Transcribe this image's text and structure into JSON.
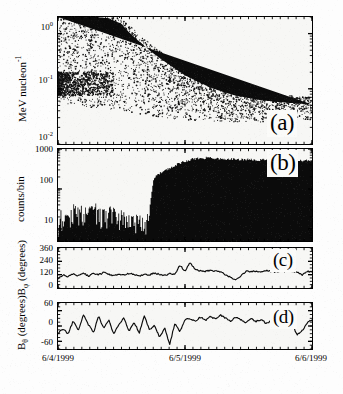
{
  "figure": {
    "background_color": "#fdfdfd",
    "ink_color": "#000000",
    "panel_fill": "#f7f7f5"
  },
  "axis": {
    "x_label_ticks": [
      "6/4/1999",
      "6/5/1999",
      "6/6/1999"
    ],
    "x_range_start": "6/4/1999",
    "x_range_end": "6/6/1999"
  },
  "panels": [
    {
      "id": "a",
      "letter": "(a)",
      "ylabel_text": "MeV nucleon",
      "ylabel_sup": "-1",
      "yticks": [
        "10",
        "10",
        "10"
      ],
      "ytick_exps": [
        "0",
        "-1",
        "-2"
      ],
      "type": "scatter"
    },
    {
      "id": "b",
      "letter": "(b)",
      "ylabel_text": "counts/bin",
      "yticks": [
        "1000",
        "100",
        "10"
      ],
      "type": "area"
    },
    {
      "id": "c",
      "letter": "(c)",
      "ylabel_text": "B",
      "ylabel_sub": "φ",
      "ylabel_unit": " (degrees)",
      "yticks": [
        "360",
        "240",
        "120",
        "0"
      ],
      "type": "line"
    },
    {
      "id": "d",
      "letter": "(d)",
      "ylabel_text": "B",
      "ylabel_sub": "θ",
      "ylabel_unit": " (degrees)",
      "yticks": [
        "60",
        "0",
        "-60"
      ],
      "type": "line"
    }
  ],
  "ylabel_combined": {
    "b_theta": "B",
    "b_theta_sub": "θ",
    "mid": " (degrees)B",
    "b_phi_sub": "φ",
    "tail": " (degrees)"
  },
  "chart_data": {
    "type": "line",
    "xlabel": "",
    "x_tick_labels": [
      "6/4/1999",
      "6/5/1999",
      "6/6/1999"
    ],
    "x_tick_fractions": [
      0.0,
      0.5,
      1.0
    ],
    "panels": [
      {
        "panel": "a",
        "type": "scatter",
        "ylabel": "MeV nucleon^-1",
        "yscale": "log",
        "ylim": [
          0.01,
          2.0
        ],
        "ytick_values": [
          1.0,
          0.1,
          0.01
        ],
        "ytick_labels": [
          "10^0",
          "10^-1",
          "10^-2"
        ],
        "description": "Ion energy vs arrival-time spectrogram showing velocity dispersion; onset boundary sweeps from high energy early to low energy later, saturating black above the boundary after 6/5/1999.",
        "dispersion_boundary": {
          "comment": "lower-energy cutoff of the dense (black) region, energy in MeV/nuc vs fraction of x axis",
          "x_fraction": [
            0.0,
            0.05,
            0.1,
            0.15,
            0.2,
            0.25,
            0.28,
            0.32,
            0.36,
            0.4,
            0.45,
            0.5,
            0.55,
            0.6,
            0.65,
            0.7,
            0.8,
            0.9,
            1.0
          ],
          "energy": [
            2.0,
            2.0,
            2.0,
            2.0,
            1.9,
            1.5,
            1.05,
            0.72,
            0.5,
            0.36,
            0.25,
            0.175,
            0.135,
            0.105,
            0.088,
            0.075,
            0.062,
            0.056,
            0.052
          ]
        },
        "sparse_cloud_lower_edge": {
          "x_fraction": [
            0.0,
            0.1,
            0.2,
            0.3,
            0.4,
            0.5,
            0.6,
            0.7,
            0.8,
            0.9,
            1.0
          ],
          "energy": [
            0.055,
            0.048,
            0.042,
            0.036,
            0.03,
            0.027,
            0.026,
            0.025,
            0.025,
            0.026,
            0.028
          ]
        }
      },
      {
        "panel": "b",
        "type": "area",
        "ylabel": "counts/bin",
        "yscale": "log",
        "ylim": [
          5,
          1000
        ],
        "ytick_values": [
          1000,
          100,
          10
        ],
        "ytick_labels": [
          "1000",
          "100",
          "10"
        ],
        "description": "Count rate histogram: quiet background near 15-30 counts/bin before onset, sharp rise at ~0.37 of the interval to a plateau near 500-600 counts/bin which persists to the end.",
        "x_fraction": [
          0.0,
          0.02,
          0.04,
          0.06,
          0.08,
          0.1,
          0.12,
          0.14,
          0.16,
          0.18,
          0.2,
          0.22,
          0.24,
          0.26,
          0.28,
          0.3,
          0.32,
          0.34,
          0.355,
          0.365,
          0.375,
          0.39,
          0.41,
          0.44,
          0.47,
          0.5,
          0.53,
          0.56,
          0.6,
          0.64,
          0.68,
          0.72,
          0.76,
          0.8,
          0.84,
          0.88,
          0.92,
          0.96,
          1.0
        ],
        "values": [
          14,
          22,
          18,
          26,
          20,
          28,
          22,
          30,
          24,
          19,
          26,
          21,
          17,
          23,
          16,
          14,
          13,
          15,
          18,
          60,
          170,
          230,
          280,
          340,
          420,
          500,
          560,
          590,
          600,
          580,
          560,
          545,
          540,
          535,
          530,
          525,
          520,
          515,
          510
        ]
      },
      {
        "panel": "c",
        "type": "line",
        "ylabel": "B_phi (degrees)",
        "yscale": "linear",
        "ylim": [
          0,
          360
        ],
        "ytick_values": [
          0,
          120,
          240,
          360
        ],
        "ytick_labels": [
          "0",
          "120",
          "240",
          "360"
        ],
        "description": "Magnetic field azimuth angle, fluctuating about 110-130 degrees with excursions up to ~230 degrees near 0.5 and a dip to ~75 degrees near 0.68.",
        "x_fraction": [
          0.0,
          0.02,
          0.04,
          0.06,
          0.08,
          0.1,
          0.12,
          0.14,
          0.16,
          0.18,
          0.2,
          0.22,
          0.24,
          0.26,
          0.28,
          0.3,
          0.32,
          0.34,
          0.36,
          0.38,
          0.4,
          0.42,
          0.44,
          0.46,
          0.48,
          0.5,
          0.52,
          0.54,
          0.56,
          0.58,
          0.6,
          0.62,
          0.64,
          0.66,
          0.68,
          0.7,
          0.72,
          0.74,
          0.76,
          0.78,
          0.8,
          0.82,
          0.84,
          0.86,
          0.88,
          0.9,
          0.92,
          0.94,
          0.96,
          0.98,
          1.0
        ],
        "values": [
          85,
          118,
          100,
          126,
          112,
          135,
          108,
          130,
          118,
          140,
          122,
          112,
          128,
          116,
          132,
          120,
          110,
          126,
          118,
          134,
          122,
          115,
          128,
          120,
          205,
          150,
          230,
          165,
          155,
          150,
          160,
          152,
          148,
          120,
          95,
          78,
          110,
          150,
          145,
          152,
          148,
          158,
          150,
          145,
          155,
          148,
          152,
          145,
          115,
          150,
          140
        ]
      },
      {
        "panel": "d",
        "type": "line",
        "ylabel": "B_theta (degrees)",
        "yscale": "linear",
        "ylim": [
          -90,
          90
        ],
        "ytick_values": [
          -60,
          0,
          60
        ],
        "ytick_labels": [
          "-60",
          "0",
          "60"
        ],
        "description": "Magnetic field elevation angle oscillating about 0 degrees with excursions between about -75 and +65 degrees; variability decreases after the shock passage.",
        "x_fraction": [
          0.0,
          0.02,
          0.04,
          0.06,
          0.08,
          0.1,
          0.12,
          0.14,
          0.16,
          0.18,
          0.2,
          0.22,
          0.24,
          0.26,
          0.28,
          0.3,
          0.32,
          0.34,
          0.36,
          0.38,
          0.4,
          0.42,
          0.44,
          0.46,
          0.48,
          0.5,
          0.52,
          0.54,
          0.56,
          0.58,
          0.6,
          0.62,
          0.64,
          0.66,
          0.68,
          0.7,
          0.72,
          0.74,
          0.76,
          0.78,
          0.8,
          0.82,
          0.84,
          0.86,
          0.88,
          0.9,
          0.92,
          0.94,
          0.96,
          0.98,
          1.0
        ],
        "values": [
          -28,
          -12,
          -30,
          20,
          -18,
          45,
          5,
          -25,
          38,
          -10,
          22,
          -32,
          8,
          30,
          -20,
          15,
          -28,
          40,
          -15,
          5,
          -45,
          -8,
          -72,
          10,
          -20,
          25,
          30,
          18,
          35,
          22,
          38,
          28,
          42,
          30,
          20,
          35,
          25,
          12,
          30,
          18,
          25,
          10,
          20,
          5,
          15,
          -10,
          20,
          -35,
          -20,
          10,
          25
        ]
      }
    ]
  }
}
